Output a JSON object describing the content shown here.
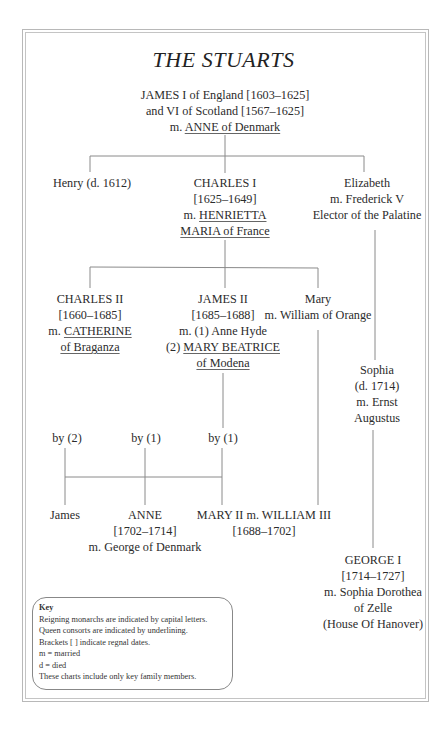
{
  "title": "THE STUARTS",
  "generations": {
    "james_i": {
      "lines": [
        "JAMES I of England [1603–1625]",
        "and VI of Scotland [1567–1625]"
      ],
      "spouse_prefix": "m. ",
      "spouse": "ANNE of Denmark"
    },
    "henry": {
      "lines": [
        "Henry (d. 1612)"
      ]
    },
    "charles_i": {
      "lines": [
        "CHARLES I",
        "[1625–1649]"
      ],
      "spouse_prefix": "m. ",
      "spouse_line1": "HENRIETTA",
      "spouse_line2": "MARIA of France"
    },
    "elizabeth": {
      "lines": [
        "Elizabeth",
        "m. Frederick V",
        "Elector of the Palatine"
      ]
    },
    "charles_ii": {
      "lines": [
        "CHARLES II",
        "[1660–1685]"
      ],
      "spouse_prefix": "m. ",
      "spouse_line1": "CATHERINE",
      "spouse_line2": "of Braganza"
    },
    "james_ii": {
      "lines": [
        "JAMES II",
        "[1685–1688]",
        "m. (1) Anne Hyde"
      ],
      "spouse_prefix": "(2) ",
      "spouse_line1": "MARY BEATRICE",
      "spouse_line2": "of Modena"
    },
    "mary": {
      "lines": [
        "Mary",
        "m. William of Orange"
      ]
    },
    "sophia": {
      "lines": [
        "Sophia",
        "(d. 1714)",
        "m. Ernst",
        "Augustus"
      ]
    },
    "by_labels": [
      "by (2)",
      "by (1)",
      "by (1)"
    ],
    "james_son": {
      "lines": [
        "James"
      ]
    },
    "anne": {
      "lines": [
        "ANNE",
        "[1702–1714]",
        "m. George of Denmark"
      ]
    },
    "mary_ii": {
      "lines": [
        "MARY II m. WILLIAM III",
        "[1688–1702]"
      ]
    },
    "george_i": {
      "lines": [
        "GEORGE I",
        "[1714–1727]",
        "m. Sophia Dorothea",
        "of Zelle",
        "(House Of Hanover)"
      ]
    }
  },
  "key": {
    "title": "Key",
    "items": [
      "Reigning monarchs are indicated by capital letters.",
      "Queen consorts are indicated by underlining.",
      "Brackets [ ] indicate regnal dates.",
      "m = married",
      "d = died",
      "These charts include only key family members."
    ]
  },
  "colors": {
    "line": "#8a8a8a",
    "frame": "#b8b8b8",
    "text": "#2b2b2b"
  }
}
